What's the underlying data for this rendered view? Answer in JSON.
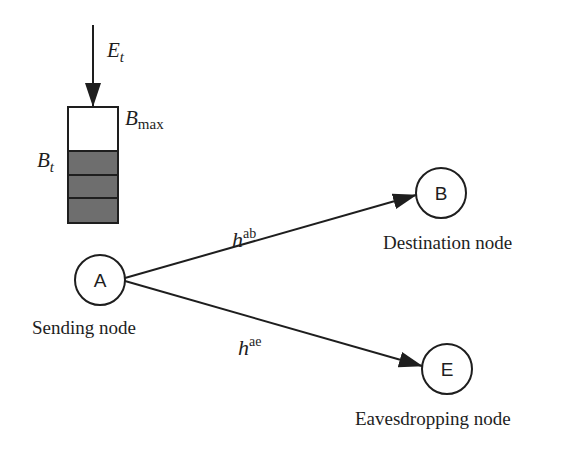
{
  "diagram": {
    "energy_arrival": {
      "label": "E",
      "subscript": "t"
    },
    "battery": {
      "max_label": "B",
      "max_subscript": "max",
      "level_label": "B",
      "level_subscript": "t",
      "filled_cells": 3,
      "fill_color": "#6e6e6e"
    },
    "nodes": {
      "sender": {
        "letter": "A",
        "caption": "Sending node"
      },
      "destination": {
        "letter": "B",
        "caption": "Destination node"
      },
      "eavesdropper": {
        "letter": "E",
        "caption": "Eavesdropping node"
      }
    },
    "links": {
      "legit": {
        "symbol": "h",
        "superscript": "ab"
      },
      "eaves": {
        "symbol": "h",
        "superscript": "ae"
      }
    }
  }
}
